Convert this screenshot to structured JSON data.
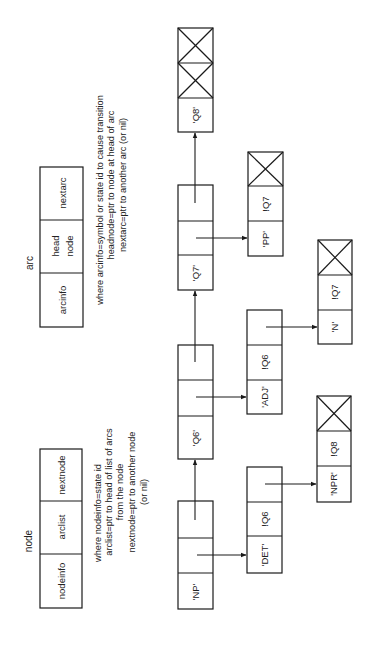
{
  "legend": {
    "node": {
      "title": "node",
      "fields": [
        "nodeinfo",
        "arclist",
        "nextnode"
      ],
      "notes": [
        "where nodeinfo=state id",
        "arclist=ptr to head of list of arcs",
        "from the node",
        "nextnode=ptr to another node",
        "(or nil)"
      ]
    },
    "arc": {
      "title": "arc",
      "fields": [
        "arcinfo",
        "head",
        "node",
        "nextarc"
      ],
      "notes": [
        "where arcinfo=symbol or state id to cause transition",
        "headnode=ptr to node at head of arc",
        "nextarc=ptr to another arc (or nil)"
      ]
    }
  },
  "nodes": [
    {
      "info": "'NP'"
    },
    {
      "info": "'Q6'"
    },
    {
      "info": "'Q7'"
    },
    {
      "info": "'Q8'"
    }
  ],
  "arcs": [
    {
      "arcinfo": "'DET'",
      "head": "!Q6"
    },
    {
      "arcinfo": "'NPR'",
      "head": "!Q8"
    },
    {
      "arcinfo": "'ADJ'",
      "head": "!Q6"
    },
    {
      "arcinfo": "'N'",
      "head": "!Q7"
    },
    {
      "arcinfo": "'PP'",
      "head": "!Q7"
    }
  ]
}
